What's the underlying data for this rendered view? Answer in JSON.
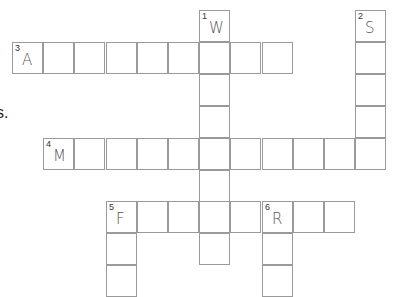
{
  "cutoff_text": "s.",
  "grid": {
    "origin_x": 12,
    "origin_y": 10,
    "col_pitch": 31.2,
    "row_pitch": 31.9,
    "border_color": "#9a9a9a",
    "letter_color": "#555555"
  },
  "words": [
    {
      "number": "1",
      "direction": "down",
      "first_letter": "W",
      "col": 6,
      "row": 0,
      "length": 8
    },
    {
      "number": "2",
      "direction": "down",
      "first_letter": "S",
      "col": 11,
      "row": 0,
      "length": 5
    },
    {
      "number": "3",
      "direction": "across",
      "first_letter": "A",
      "col": 0,
      "row": 1,
      "length": 9
    },
    {
      "number": "4",
      "direction": "across",
      "first_letter": "M",
      "col": 1,
      "row": 4,
      "length": 11
    },
    {
      "number": "5",
      "direction": "across",
      "first_letter": "F",
      "col": 3,
      "row": 6,
      "length": 8
    },
    {
      "number": "5",
      "direction": "down",
      "first_letter": "F",
      "col": 3,
      "row": 6,
      "length": 3
    },
    {
      "number": "6",
      "direction": "down",
      "first_letter": "R",
      "col": 8,
      "row": 6,
      "length": 3
    }
  ]
}
